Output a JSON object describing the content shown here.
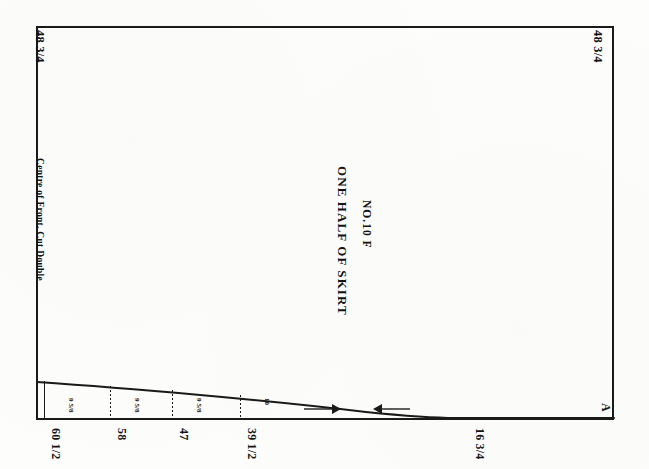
{
  "sheet": {
    "background_color": "#fdfdfb",
    "ink_color": "#131313"
  },
  "pattern": {
    "title": "ONE HALF OF SKIRT",
    "number": "NO.10 F",
    "grainline_note": "Centre of Front. Cut Double",
    "corner_top_left": "48 3/4",
    "corner_top_right": "48 3/4",
    "edge_marker_right": "A"
  },
  "measurements": [
    {
      "label": "60 1/2",
      "small": "9 5/8",
      "x": 44
    },
    {
      "label": "58",
      "small": "9 5/8",
      "x": 110
    },
    {
      "label": "47",
      "small": "9 5/8",
      "x": 172
    },
    {
      "label": "39 1/2",
      "small": "10",
      "x": 240
    },
    {
      "label": "16 3/4",
      "small": "",
      "x": 468
    }
  ],
  "arrows": [
    {
      "direction": "right",
      "x": 310
    },
    {
      "direction": "left",
      "x": 380
    }
  ],
  "chart_data": {
    "type": "line",
    "title": "ONE HALF OF SKIRT",
    "xlabel": "",
    "ylabel": "",
    "annotations": [
      "48 3/4",
      "48 3/4",
      "A",
      "NO.10 F",
      "Centre of Front. Cut Double"
    ],
    "categories": [
      "60 1/2",
      "58",
      "47",
      "39 1/2",
      "16 3/4"
    ],
    "values": [
      60.5,
      58,
      47,
      39.5,
      16.75
    ]
  }
}
